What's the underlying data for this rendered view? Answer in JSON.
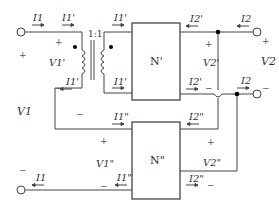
{
  "diagram": {
    "transformer": {
      "ratio": "1:1"
    },
    "networks": {
      "top": "N'",
      "bottom": "N\""
    },
    "currents": {
      "I1_top_left": "I1",
      "I1p_top_primary": "I1'",
      "I1p_top_secondary": "I1'",
      "I1p_bottom_primary": "I1'",
      "I1p_bottom_secondary": "I1'",
      "I2p_top": "I2'",
      "I2_top": "I2",
      "I2p_bottom": "I2'",
      "I2_bottom": "I2",
      "I1pp_top": "I1\"",
      "I2pp_top": "I2\"",
      "I1_bottom_left": "I1",
      "I1pp_bottom": "I1\"",
      "I2pp_bottom": "I2\""
    },
    "voltages": {
      "V1": "V1",
      "V1p": "V1'",
      "V2": "V2",
      "V2p": "V2'",
      "V1pp": "V1\"",
      "V2pp": "V2\""
    },
    "signs": {
      "plus": "+",
      "minus": "−"
    }
  }
}
